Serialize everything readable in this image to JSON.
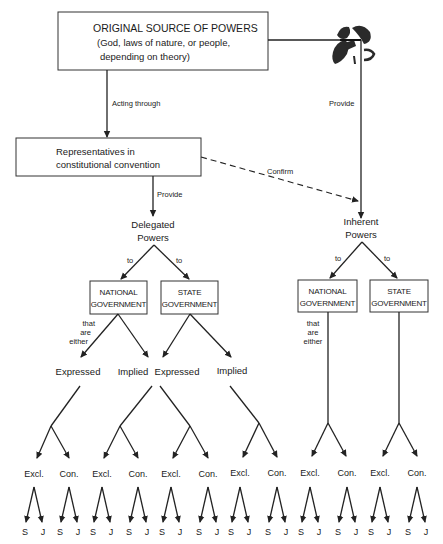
{
  "source_box": {
    "title": "ORIGINAL SOURCE OF POWERS",
    "line2": "(God, laws of nature, or people,",
    "line3": "depending on theory)"
  },
  "edges": {
    "acting_through": "Acting through",
    "provide_right": "Provide",
    "provide_left": "Provide",
    "confirm": "Confirm"
  },
  "convention_box": {
    "line1": "Representatives in",
    "line2": "constitutional convention"
  },
  "delegated": {
    "line1": "Delegated",
    "line2": "Powers",
    "to_left": "to",
    "to_right": "to",
    "national": {
      "line1": "NATIONAL",
      "line2": "GOVERNMENT",
      "qualifier": [
        "that",
        "are",
        "either"
      ]
    },
    "state": {
      "line1": "STATE",
      "line2": "GOVERNMENT"
    },
    "types": [
      "Expressed",
      "Implied",
      "Expressed",
      "Implied"
    ]
  },
  "inherent": {
    "line1": "Inherent",
    "line2": "Powers",
    "to_left": "to",
    "to_right": "to",
    "national": {
      "line1": "NATIONAL",
      "line2": "GOVERNMENT",
      "qualifier": [
        "that",
        "are",
        "either"
      ]
    },
    "state": {
      "line1": "STATE",
      "line2": "GOVERNMENT"
    }
  },
  "leaf_groups": [
    {
      "left": "Excl.",
      "right": "Con."
    },
    {
      "left": "Excl.",
      "right": "Con."
    },
    {
      "left": "Excl.",
      "right": "Con."
    },
    {
      "left": "Excl.",
      "right": "Con."
    },
    {
      "left": "Excl.",
      "right": "Con."
    },
    {
      "left": "Excl.",
      "right": "Con."
    }
  ],
  "leaf_sub": {
    "left": "S",
    "right": "J"
  },
  "colors": {
    "ink": "#1a1a1a",
    "paper": "#ffffff"
  }
}
